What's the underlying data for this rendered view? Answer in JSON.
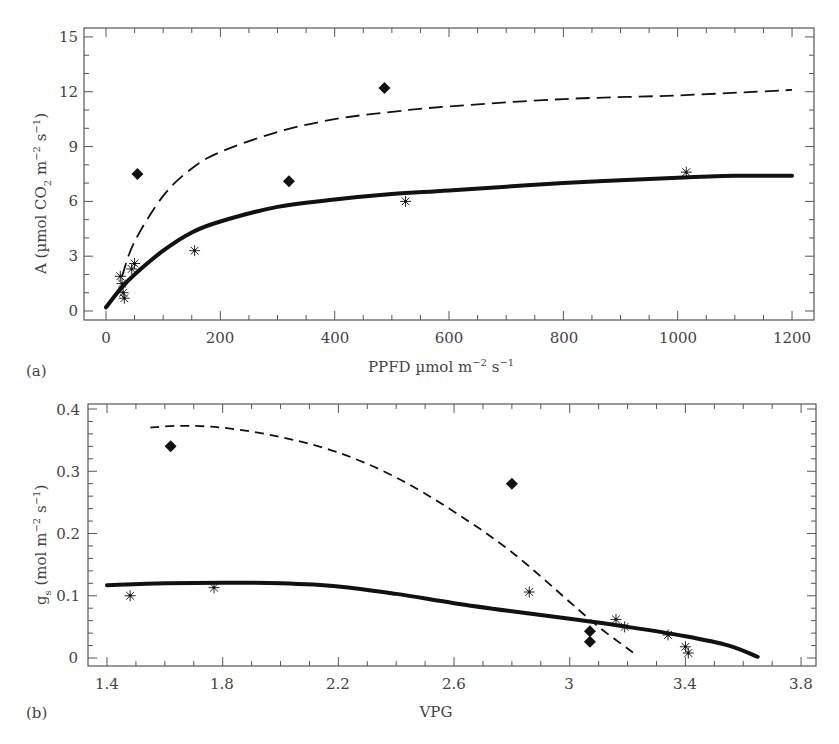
{
  "chart_data": [
    {
      "panel": "(a)",
      "type": "scatter",
      "title": "",
      "xlabel": "PPFD µmol m⁻² s⁻¹",
      "ylabel": "A (µmol CO₂ m⁻² s⁻¹)",
      "xlim": [
        -30,
        1230
      ],
      "ylim": [
        -0.8,
        15.2
      ],
      "xticks": [
        0,
        200,
        400,
        600,
        800,
        1000,
        1200
      ],
      "yticks": [
        0,
        3,
        6,
        9,
        12,
        15
      ],
      "grid": false,
      "series": [
        {
          "name": "diamonds",
          "marker": "diamond",
          "points": [
            [
              55,
              7.5
            ],
            [
              320,
              7.1
            ],
            [
              487,
              12.2
            ]
          ]
        },
        {
          "name": "asterisks",
          "marker": "asterisk",
          "points": [
            [
              25,
              1.9
            ],
            [
              28,
              1.5
            ],
            [
              30,
              1.0
            ],
            [
              32,
              0.7
            ],
            [
              45,
              2.3
            ],
            [
              50,
              2.6
            ],
            [
              155,
              3.3
            ],
            [
              524,
              6.0
            ],
            [
              1015,
              7.6
            ]
          ]
        },
        {
          "name": "fit-dashed",
          "style": "dashed",
          "points": [
            [
              28,
              1.9
            ],
            [
              50,
              3.8
            ],
            [
              100,
              6.3
            ],
            [
              150,
              7.8
            ],
            [
              200,
              8.7
            ],
            [
              300,
              9.8
            ],
            [
              400,
              10.5
            ],
            [
              500,
              10.9
            ],
            [
              600,
              11.2
            ],
            [
              800,
              11.6
            ],
            [
              1000,
              11.8
            ],
            [
              1200,
              12.1
            ]
          ]
        },
        {
          "name": "fit-solid",
          "style": "solid",
          "points": [
            [
              0,
              0.2
            ],
            [
              25,
              1.2
            ],
            [
              50,
              2.0
            ],
            [
              100,
              3.3
            ],
            [
              150,
              4.3
            ],
            [
              200,
              4.9
            ],
            [
              300,
              5.7
            ],
            [
              400,
              6.1
            ],
            [
              500,
              6.4
            ],
            [
              600,
              6.6
            ],
            [
              800,
              7.0
            ],
            [
              1000,
              7.3
            ],
            [
              1100,
              7.4
            ],
            [
              1200,
              7.4
            ]
          ]
        }
      ]
    },
    {
      "panel": "(b)",
      "type": "scatter",
      "title": "",
      "xlabel": "VPG",
      "ylabel": "gₛ (mol m⁻² s⁻¹)",
      "xlim": [
        1.33,
        3.87
      ],
      "ylim": [
        -0.012,
        0.41
      ],
      "xticks": [
        1.4,
        1.8,
        2.2,
        2.6,
        3.0,
        3.4,
        3.8
      ],
      "xtick_labels": [
        "1.4",
        "1.8",
        "2.2",
        "2.6",
        "3",
        "3.4",
        "3.8"
      ],
      "yticks": [
        0,
        0.1,
        0.2,
        0.3,
        0.4
      ],
      "grid": false,
      "series": [
        {
          "name": "diamonds",
          "marker": "diamond",
          "points": [
            [
              1.62,
              0.34
            ],
            [
              2.8,
              0.28
            ],
            [
              3.07,
              0.043
            ],
            [
              3.07,
              0.026
            ]
          ]
        },
        {
          "name": "asterisks",
          "marker": "asterisk",
          "points": [
            [
              1.48,
              0.1
            ],
            [
              1.77,
              0.113
            ],
            [
              2.86,
              0.106
            ],
            [
              3.16,
              0.062
            ],
            [
              3.19,
              0.05
            ],
            [
              3.34,
              0.037
            ],
            [
              3.4,
              0.018
            ],
            [
              3.41,
              0.008
            ]
          ]
        },
        {
          "name": "fit-dashed",
          "style": "dashed",
          "points": [
            [
              1.55,
              0.37
            ],
            [
              1.65,
              0.373
            ],
            [
              1.8,
              0.37
            ],
            [
              2.0,
              0.355
            ],
            [
              2.2,
              0.33
            ],
            [
              2.4,
              0.29
            ],
            [
              2.6,
              0.235
            ],
            [
              2.8,
              0.17
            ],
            [
              3.0,
              0.09
            ],
            [
              3.1,
              0.05
            ],
            [
              3.23,
              0.005
            ]
          ]
        },
        {
          "name": "fit-solid",
          "style": "solid",
          "points": [
            [
              1.4,
              0.117
            ],
            [
              1.6,
              0.12
            ],
            [
              1.8,
              0.121
            ],
            [
              2.0,
              0.12
            ],
            [
              2.2,
              0.115
            ],
            [
              2.4,
              0.103
            ],
            [
              2.6,
              0.088
            ],
            [
              2.8,
              0.075
            ],
            [
              3.0,
              0.063
            ],
            [
              3.2,
              0.05
            ],
            [
              3.4,
              0.035
            ],
            [
              3.55,
              0.02
            ],
            [
              3.65,
              0.002
            ]
          ]
        }
      ]
    }
  ],
  "labels": {
    "a": {
      "panel": "(a)",
      "xlabel_main": "PPFD µmol m",
      "xlabel_exp1": "−2",
      "xlabel_mid": " s",
      "xlabel_exp2": "−1",
      "ylabel_main": "A (µmol CO",
      "ylabel_sub": "2",
      "ylabel_mid": " m",
      "ylabel_exp1": "−2",
      "ylabel_mid2": " s",
      "ylabel_exp2": "−1",
      "ylabel_end": ")",
      "xticks": [
        "0",
        "200",
        "400",
        "600",
        "800",
        "1000",
        "1200"
      ],
      "yticks": [
        "0",
        "3",
        "6",
        "9",
        "12",
        "15"
      ]
    },
    "b": {
      "panel": "(b)",
      "xlabel": "VPG",
      "ylabel_g": "g",
      "ylabel_sub": "s",
      "ylabel_main": " (mol m",
      "ylabel_exp1": "−2",
      "ylabel_mid": " s",
      "ylabel_exp2": "−1",
      "ylabel_end": ")",
      "xticks": [
        "1.4",
        "1.8",
        "2.2",
        "2.6",
        "3",
        "3.4",
        "3.8"
      ],
      "yticks": [
        "0",
        "0.1",
        "0.2",
        "0.3",
        "0.4"
      ]
    }
  },
  "colors": {
    "axis": "#555555",
    "ink": "#111111",
    "text": "#444444"
  }
}
